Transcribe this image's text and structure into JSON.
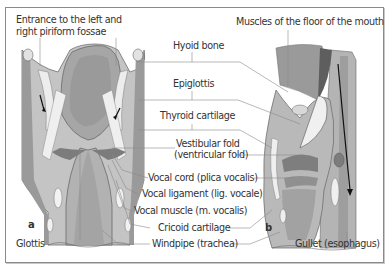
{
  "figure": {
    "panels": [
      {
        "id": "a",
        "label": "a",
        "view": "posterior coronal view of larynx"
      },
      {
        "id": "b",
        "label": "b",
        "view": "sagittal section of larynx"
      }
    ],
    "labels": {
      "piriform": "Entrance to the left and",
      "piriform2": "right piriform fossae",
      "floor_mouth": "Muscles of the floor of the mouth",
      "hyoid": "Hyoid bone",
      "epiglottis": "Epiglottis",
      "thyroid": "Thyroid cartilage",
      "vestibular": "Vestibular fold",
      "vestibular2": "(ventricular fold)",
      "vocal_cord": "Vocal cord (plica vocalis)",
      "vocal_ligament": "Vocal ligament (lig. vocale)",
      "vocal_muscle": "Vocal muscle (m. vocalis)",
      "cricoid": "Cricoid cartilage",
      "windpipe": "Windpipe (trachea)",
      "glottis": "Glottis",
      "gullet": "Gullet (esophagus)"
    },
    "colors": {
      "tissue_light": "#c9c9c9",
      "tissue_mid": "#a9a9a9",
      "tissue_dark": "#8c8c8c",
      "cartilage": "#ececec",
      "leader_line": "#8a8a8a",
      "text": "#333333"
    }
  }
}
